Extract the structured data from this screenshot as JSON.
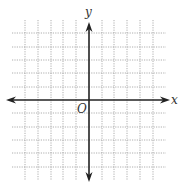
{
  "diagram": {
    "type": "coordinate-plane",
    "x_axis_label": "x",
    "y_axis_label": "y",
    "origin_label": "O",
    "grid": {
      "vertical_lines_x": [
        25,
        38,
        51,
        63,
        76,
        102,
        114,
        127,
        140,
        153
      ],
      "horizontal_lines_y": [
        33,
        47,
        60,
        73,
        87,
        113,
        127,
        140,
        153,
        167
      ],
      "h_extent": [
        12,
        166
      ],
      "v_extent": [
        20,
        180
      ],
      "style": "dotted",
      "color": "#9a9a9a"
    },
    "axes": {
      "x_axis_y": 100,
      "y_axis_x": 89,
      "x_range_px": [
        6,
        170
      ],
      "y_range_px": [
        22,
        182
      ],
      "color": "#222222"
    }
  }
}
